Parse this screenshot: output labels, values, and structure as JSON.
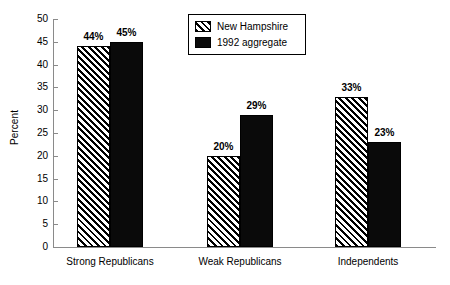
{
  "chart_data": {
    "type": "bar",
    "title": "",
    "subtitle": "",
    "xlabel": "",
    "ylabel": "Percent",
    "categories": [
      "Strong Republicans",
      "Weak Republicans",
      "Independents"
    ],
    "series": [
      {
        "name": "New Hampshire",
        "fill": "hatch",
        "color": "#000000",
        "values": [
          44,
          20,
          33
        ],
        "labels": [
          "44%",
          "20%",
          "33%"
        ]
      },
      {
        "name": "1992 aggregate",
        "fill": "solid",
        "color": "#0a0a0a",
        "values": [
          45,
          29,
          23
        ],
        "labels": [
          "45%",
          "29%",
          "23%"
        ]
      }
    ],
    "ylim": [
      0,
      50
    ],
    "ytick_values": [
      0,
      5,
      10,
      15,
      20,
      25,
      30,
      35,
      40,
      45,
      50
    ],
    "ytick_labels": [
      "0",
      "5",
      "10",
      "15",
      "20",
      "25",
      "30",
      "35",
      "40",
      "45",
      "50"
    ],
    "grid": false,
    "legend_position": "top-center",
    "axis_color": "#8a8a8a",
    "background": "#ffffff"
  },
  "legend": {
    "entries": [
      {
        "label": "New Hampshire"
      },
      {
        "label": "1992 aggregate"
      }
    ]
  }
}
